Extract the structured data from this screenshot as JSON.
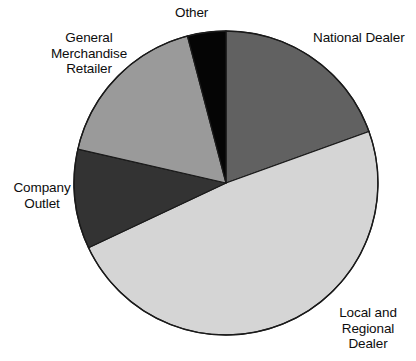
{
  "figure": {
    "background_color": "#ffffff",
    "outline_color": "#1a1a1a",
    "width": 416,
    "height": 361
  },
  "labels": {
    "other": "Other",
    "national_dealer": "National Dealer",
    "general_merchandise_retailer": "General\nMerchandise\nRetailer",
    "company_outlet": "Company\nOutlet",
    "local_and_regional_dealer": "Local and\nRegional Dealer"
  },
  "chart_data": {
    "type": "pie",
    "title": "",
    "subtitle": "",
    "xlabel": "",
    "ylabel": "",
    "legend_position": "none",
    "labels_position": "outside-callout-free",
    "start_angle_deg": 0,
    "direction": "clockwise",
    "center": {
      "x": 226,
      "y": 183
    },
    "radius": 152,
    "categories": [
      "National Dealer",
      "Local and Regional Dealer",
      "Company Outlet",
      "General Merchandise Retailer",
      "Other"
    ],
    "values": [
      19.5,
      48.5,
      10.6,
      17.3,
      4.1
    ],
    "units": "percent",
    "slices": [
      {
        "name": "National Dealer",
        "value": 19.5,
        "start_deg": 0.0,
        "end_deg": 70.2,
        "color": "#616161"
      },
      {
        "name": "Local and Regional Dealer",
        "value": 48.5,
        "start_deg": 70.2,
        "end_deg": 244.8,
        "color": "#d5d5d5"
      },
      {
        "name": "Company Outlet",
        "value": 10.6,
        "start_deg": 244.8,
        "end_deg": 282.9,
        "color": "#333333"
      },
      {
        "name": "General Merchandise Retailer",
        "value": 17.3,
        "start_deg": 282.9,
        "end_deg": 345.3,
        "color": "#9a9a9a"
      },
      {
        "name": "Other",
        "value": 4.1,
        "start_deg": 345.3,
        "end_deg": 360.0,
        "color": "#050505"
      }
    ]
  }
}
